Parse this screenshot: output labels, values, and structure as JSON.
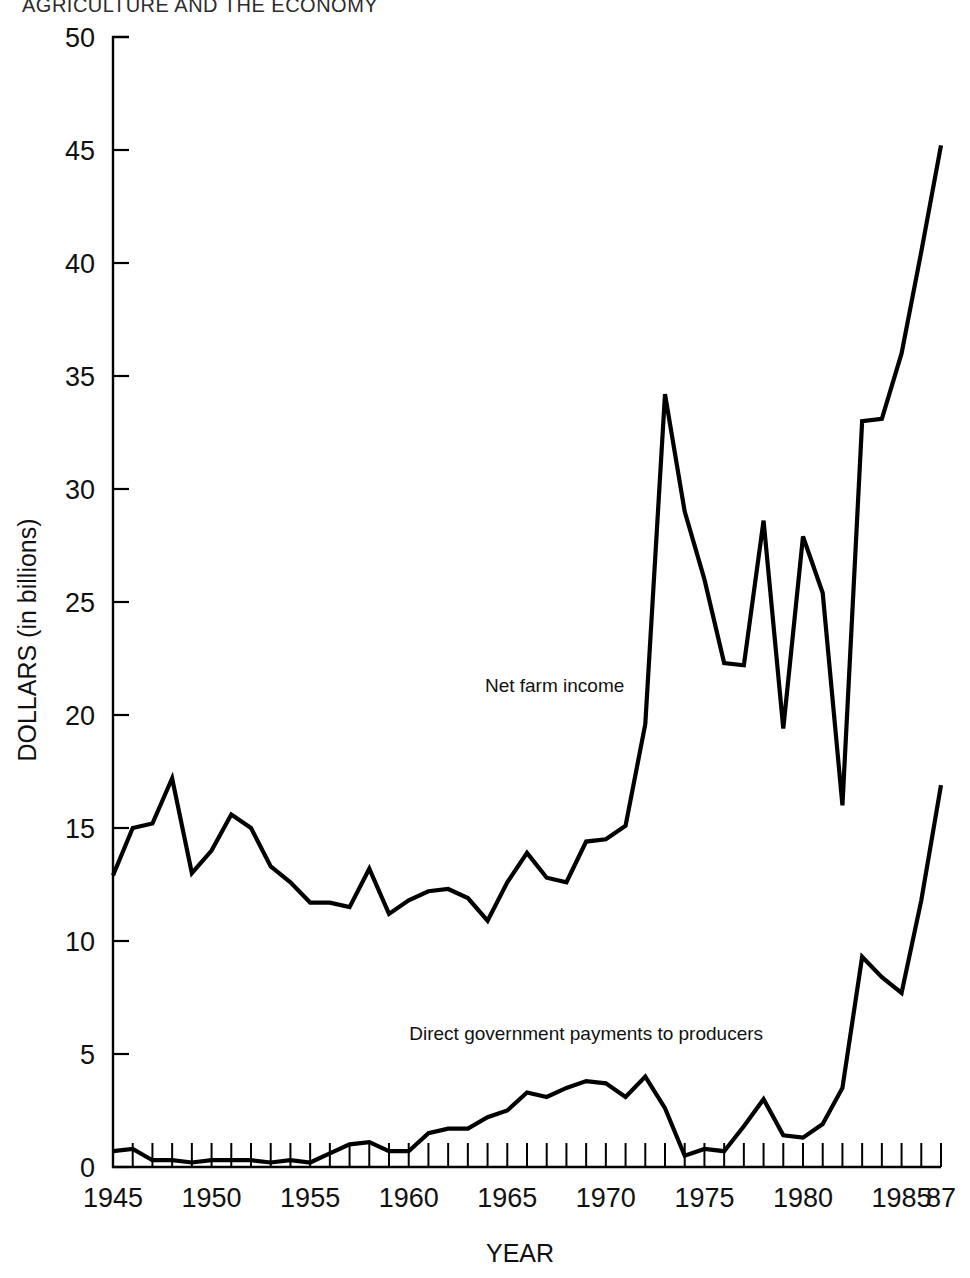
{
  "page": {
    "running_header": "AGRICULTURE AND THE ECONOMY"
  },
  "chart_data": {
    "type": "line",
    "title": "",
    "xlabel": "YEAR",
    "ylabel": "DOLLARS (in billions)",
    "xlim": [
      1945,
      1987
    ],
    "ylim": [
      0,
      50
    ],
    "grid": false,
    "legend_position": "inline-annotation",
    "y_ticks": [
      0,
      5,
      10,
      15,
      20,
      25,
      30,
      35,
      40,
      45,
      50
    ],
    "y_tick_labels": [
      "0",
      "5",
      "10",
      "15",
      "20",
      "25",
      "30",
      "35",
      "40",
      "45",
      "50"
    ],
    "x_ticks": [
      1945,
      1950,
      1955,
      1960,
      1965,
      1970,
      1975,
      1980,
      1985,
      1987
    ],
    "x_tick_labels": [
      "1945",
      "1950",
      "1955",
      "1960",
      "1965",
      "1970",
      "1975",
      "1980",
      "1985",
      "87"
    ],
    "x_minor_tick_step": 1,
    "x": [
      1945,
      1946,
      1947,
      1948,
      1949,
      1950,
      1951,
      1952,
      1953,
      1954,
      1955,
      1956,
      1957,
      1958,
      1959,
      1960,
      1961,
      1962,
      1963,
      1964,
      1965,
      1966,
      1967,
      1968,
      1969,
      1970,
      1971,
      1972,
      1973,
      1974,
      1975,
      1976,
      1977,
      1978,
      1979,
      1980,
      1981,
      1982,
      1983,
      1984,
      1985,
      1986,
      1987
    ],
    "series": [
      {
        "name": "Net farm income",
        "label": "Net farm income",
        "color": "#000000",
        "values": [
          12.9,
          15.0,
          15.2,
          17.2,
          13.0,
          14.0,
          15.6,
          15.0,
          13.3,
          12.6,
          11.7,
          11.7,
          11.5,
          13.2,
          11.2,
          11.8,
          12.2,
          12.3,
          11.9,
          10.9,
          12.6,
          13.9,
          12.8,
          12.6,
          14.4,
          14.5,
          15.1,
          19.6,
          34.2,
          29.0,
          26.0,
          22.3,
          22.2,
          28.6,
          19.4,
          27.9,
          25.4,
          16.0,
          33.0,
          33.1,
          36.0,
          40.5,
          45.2
        ]
      },
      {
        "name": "Direct government payments to producers",
        "label": "Direct government payments to producers",
        "color": "#000000",
        "values": [
          0.7,
          0.8,
          0.3,
          0.3,
          0.2,
          0.3,
          0.3,
          0.3,
          0.2,
          0.3,
          0.2,
          0.6,
          1.0,
          1.1,
          0.7,
          0.7,
          1.5,
          1.7,
          1.7,
          2.2,
          2.5,
          3.3,
          3.1,
          3.5,
          3.8,
          3.7,
          3.1,
          4.0,
          2.6,
          0.5,
          0.8,
          0.7,
          1.8,
          3.0,
          1.4,
          1.3,
          1.9,
          3.5,
          9.3,
          8.4,
          7.7,
          11.8,
          16.9
        ]
      }
    ],
    "annotations": [
      {
        "text": "Net farm income",
        "x": 1967.4,
        "y": 21.0
      },
      {
        "text": "Direct government payments to producers",
        "x": 1969.0,
        "y": 5.6
      }
    ]
  }
}
